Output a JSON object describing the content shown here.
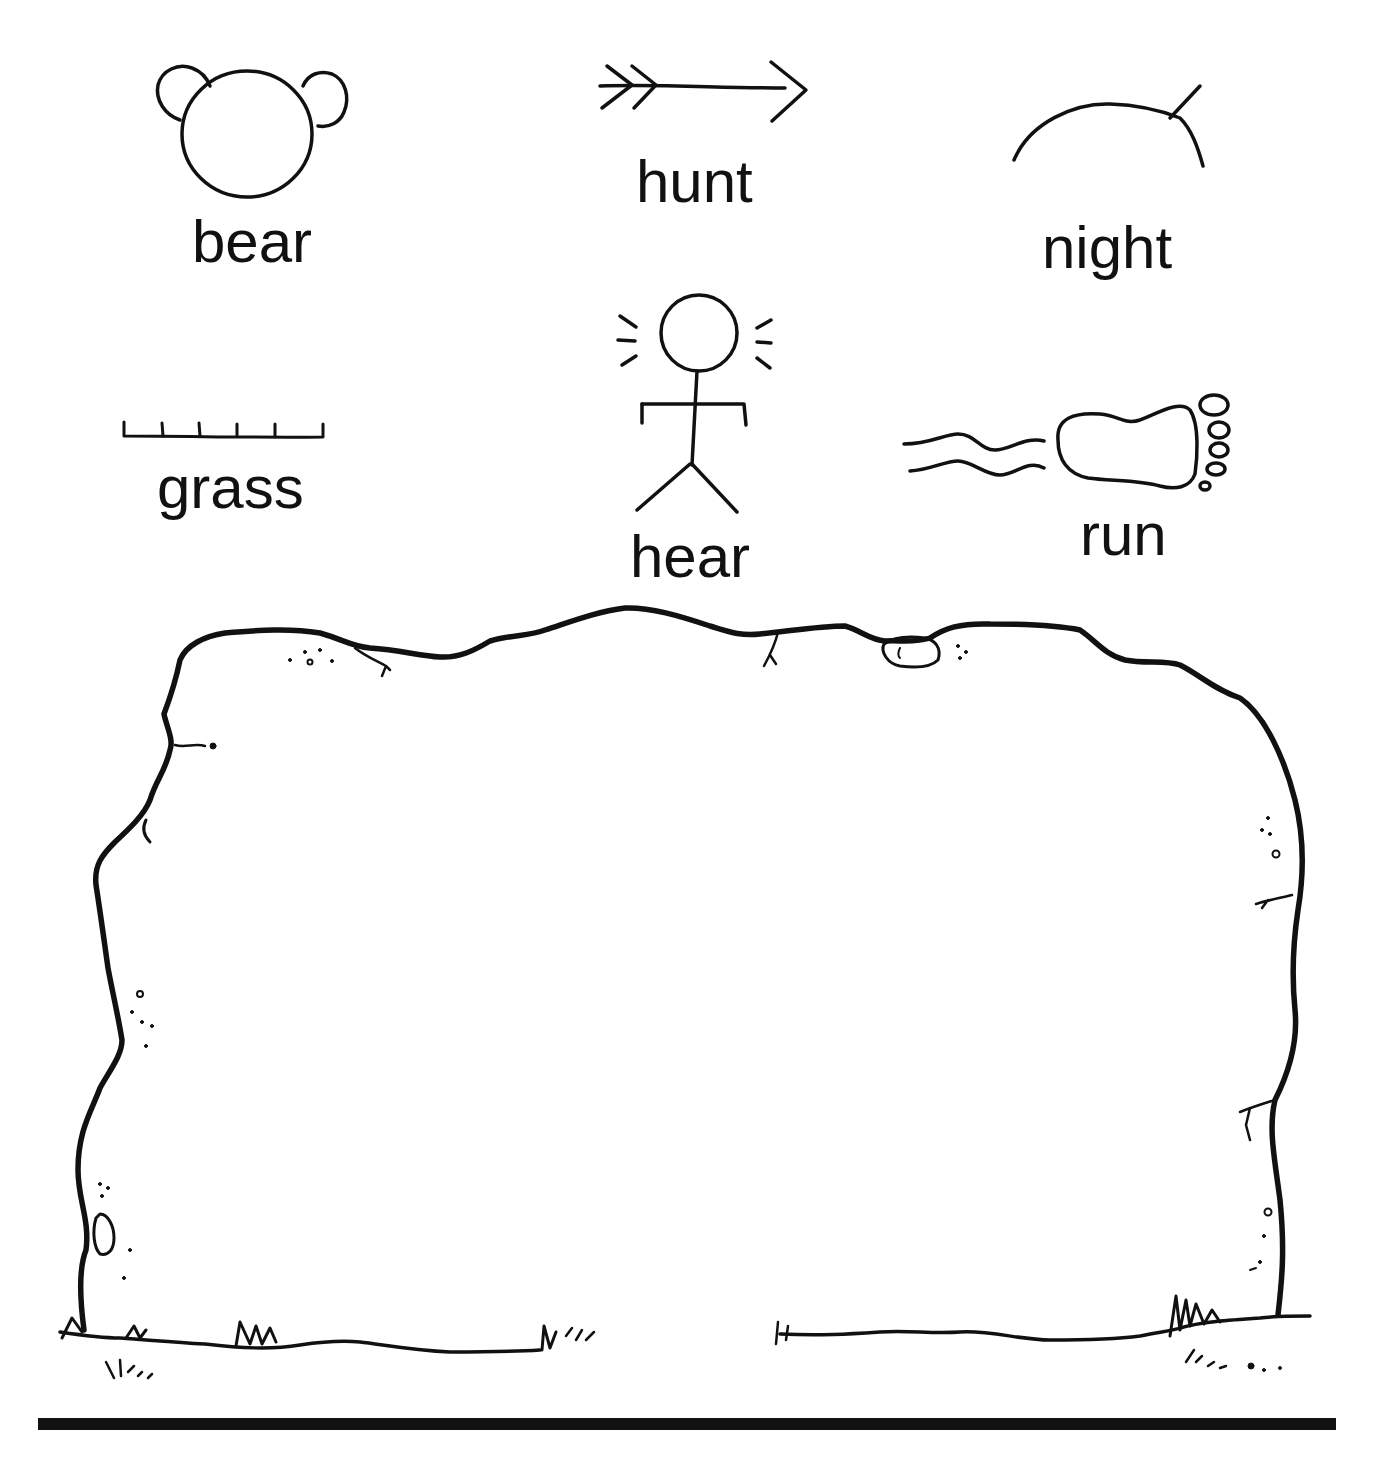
{
  "worksheet": {
    "pictographs": [
      {
        "id": "bear",
        "label": "bear",
        "icon": "bear-face-icon"
      },
      {
        "id": "hunt",
        "label": "hunt",
        "icon": "arrow-icon"
      },
      {
        "id": "night",
        "label": "night",
        "icon": "moon-arc-icon"
      },
      {
        "id": "grass",
        "label": "grass",
        "icon": "grass-line-icon"
      },
      {
        "id": "hear",
        "label": "hear",
        "icon": "stick-figure-listening-icon"
      },
      {
        "id": "run",
        "label": "run",
        "icon": "footprint-speed-icon"
      }
    ],
    "drawing_area": {
      "shape": "rock-outline",
      "content": ""
    },
    "colors": {
      "ink": "#111111",
      "paper": "#ffffff"
    }
  }
}
